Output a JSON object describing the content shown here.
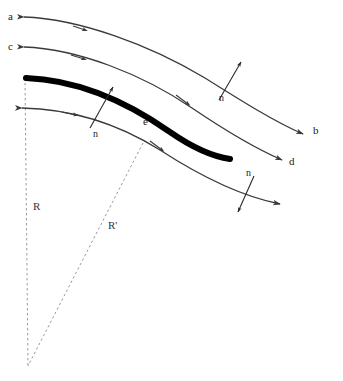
{
  "figure": {
    "type": "schematic-diagram",
    "background_color": "#ffffff",
    "width": 343,
    "height": 381,
    "stroke_color_thin": "#3a3a3a",
    "stroke_color_thick": "#000000",
    "dashed_color": "#9a9a9a"
  },
  "labels": {
    "a": "a",
    "b": "b",
    "c": "c",
    "d": "d",
    "e": "e",
    "n1": "n",
    "n2": "n",
    "n3": "n",
    "R": "R",
    "Rprime": "R'"
  },
  "label_positions": {
    "a": {
      "x": 8,
      "y": 11
    },
    "b": {
      "x": 313,
      "y": 125
    },
    "c": {
      "x": 8,
      "y": 41
    },
    "d": {
      "x": 289,
      "y": 156
    },
    "e": {
      "x": 143,
      "y": 116
    },
    "n1": {
      "x": 93,
      "y": 129
    },
    "n2": {
      "x": 219,
      "y": 93
    },
    "n3": {
      "x": 246,
      "y": 168
    },
    "R": {
      "x": 33,
      "y": 201
    },
    "Rprime": {
      "x": 108,
      "y": 220
    }
  },
  "streamlines": [
    {
      "name": "streamline-a-b",
      "start_label": "a",
      "end_label": "b",
      "path": "M 24,17 C 80,19 150,45 205,78 C 240,100 275,122 303,134",
      "head_at_start": true,
      "head_at_end": true,
      "mid_arrow_t": 0.18
    },
    {
      "name": "streamline-c-d",
      "start_label": "c",
      "end_label": "d",
      "path": "M 24,47 C 78,49 142,74 192,108 C 226,131 259,150 282,160",
      "head_at_start": true,
      "head_at_end": true,
      "mid_arrow_t": 0.18
    },
    {
      "name": "streamline-lower",
      "start_label": "",
      "end_label": "",
      "path": "M 22,108 C 72,109 120,125 160,150 C 200,176 240,196 280,204",
      "head_at_start": true,
      "head_at_end": true,
      "mid_arrow_t": 0.2
    }
  ],
  "thick_curve": {
    "name": "shock-front",
    "path": "M 26,78 C 80,80 130,104 170,132 C 196,150 216,157 230,159",
    "stroke_width": 6,
    "color": "#000000"
  },
  "normals": [
    {
      "name": "normal-vector-left",
      "label": "n",
      "from": {
        "x": 90,
        "y": 128
      },
      "to": {
        "x": 112,
        "y": 88
      },
      "direction": "outward-up-right"
    },
    {
      "name": "normal-vector-upper-right",
      "label": "n",
      "from": {
        "x": 220,
        "y": 92
      },
      "to": {
        "x": 240,
        "y": 62
      },
      "direction": "outward-up-right"
    },
    {
      "name": "normal-vector-lower-right",
      "label": "n",
      "from": {
        "x": 253,
        "y": 176
      },
      "to": {
        "x": 239,
        "y": 210
      },
      "direction": "inward-down-left"
    }
  ],
  "radii": [
    {
      "name": "radius-R",
      "label": "R",
      "from": {
        "x": 25,
        "y": 78
      },
      "to": {
        "x": 28,
        "y": 366
      },
      "style": "dashed"
    },
    {
      "name": "radius-R-prime",
      "label": "R'",
      "from": {
        "x": 143,
        "y": 143
      },
      "to": {
        "x": 28,
        "y": 366
      },
      "style": "dashed"
    }
  ],
  "center_point": {
    "x": 28,
    "y": 366
  }
}
